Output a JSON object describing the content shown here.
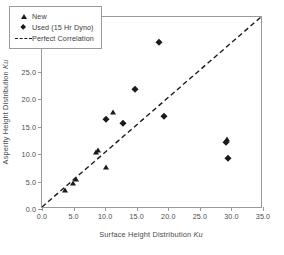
{
  "chart_data": {
    "type": "scatter",
    "title": "",
    "xlabel": "Surface Height Distribution Ku",
    "ylabel": "Asperity Height Distribution Ku",
    "xlim": [
      0.0,
      35.0
    ],
    "ylim": [
      0.0,
      35.0
    ],
    "xticks": [
      "0.0",
      "5.0",
      "10.0",
      "15.0",
      "20.0",
      "25.0",
      "30.0",
      "35.0"
    ],
    "yticks": [
      "0.0",
      "5.0",
      "10.0",
      "15.0",
      "20.0",
      "25.0",
      "30.0",
      "35.0"
    ],
    "xtick_values": [
      0,
      5,
      10,
      15,
      20,
      25,
      30,
      35
    ],
    "ytick_values": [
      0,
      5,
      10,
      15,
      20,
      25,
      30,
      35
    ],
    "grid": false,
    "legend_position": "top-left",
    "series": [
      {
        "name": "New",
        "marker": "triangle",
        "color": "#1a1a1a",
        "points": [
          [
            3.6,
            3.5
          ],
          [
            4.9,
            4.7
          ],
          [
            5.4,
            5.4
          ],
          [
            8.5,
            10.3
          ],
          [
            8.9,
            10.7
          ],
          [
            10.2,
            7.6
          ],
          [
            11.2,
            17.6
          ],
          [
            29.3,
            12.7
          ]
        ]
      },
      {
        "name": "Used (15 Hr Dyno)",
        "marker": "diamond",
        "color": "#1a1a1a",
        "points": [
          [
            10.2,
            16.4
          ],
          [
            12.8,
            15.6
          ],
          [
            14.8,
            21.8
          ],
          [
            18.5,
            30.5
          ],
          [
            19.4,
            16.9
          ],
          [
            29.1,
            12.2
          ],
          [
            29.5,
            9.3
          ]
        ]
      }
    ],
    "reference_line": {
      "name": "Perfect Correlation",
      "style": "dashed",
      "color": "#1a1a1a",
      "from": [
        0.0,
        0.0
      ],
      "to": [
        35.0,
        35.0
      ]
    }
  },
  "legend": {
    "items": [
      {
        "label": "New",
        "key": "triangle-marker-icon"
      },
      {
        "label": "Used (15 Hr Dyno)",
        "key": "diamond-marker-icon"
      },
      {
        "label": "Perfect Correlation",
        "key": "dashed-line-icon"
      }
    ]
  },
  "axis_titles": {
    "x_main": "Surface Height Distribution",
    "x_symbol": "Ku",
    "y_main": "Asperity Height Distribution",
    "y_symbol": "Ku"
  }
}
